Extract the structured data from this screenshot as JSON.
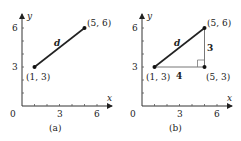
{
  "figure": {
    "panels": [
      {
        "id": "a",
        "caption": "(a)",
        "x_axis_label": "x",
        "y_axis_label": "y",
        "origin_label": "0",
        "x_ticks": [
          "3",
          "6"
        ],
        "y_ticks": [
          "3",
          "6"
        ],
        "points": [
          {
            "label": "(1, 3)",
            "x": 1,
            "y": 3
          },
          {
            "label": "(5, 6)",
            "x": 5,
            "y": 6
          }
        ],
        "segment_label": "d"
      },
      {
        "id": "b",
        "caption": "(b)",
        "x_axis_label": "x",
        "y_axis_label": "y",
        "origin_label": "0",
        "x_ticks": [
          "3",
          "6"
        ],
        "y_ticks": [
          "3",
          "6"
        ],
        "points": [
          {
            "label": "(1, 3)",
            "x": 1,
            "y": 3
          },
          {
            "label": "(5, 6)",
            "x": 5,
            "y": 6
          },
          {
            "label": "(5, 3)",
            "x": 5,
            "y": 3
          }
        ],
        "segment_label": "d",
        "horizontal_leg_label": "4",
        "vertical_leg_label": "3"
      }
    ],
    "colors": {
      "line": "#222222",
      "leg": "#777777"
    }
  }
}
